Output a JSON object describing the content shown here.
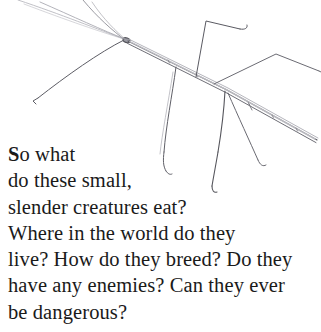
{
  "page": {
    "background_color": "#ffffff",
    "width": 321,
    "height": 332
  },
  "illustration": {
    "subject": "stick-insect",
    "alt_name": "walking stick insect pencil sketch",
    "style": "pencil line drawing",
    "line_color": "#4a4a50",
    "light_line_color": "#9b9ba3"
  },
  "caption": {
    "text_color": "#1a1a1a",
    "drop_cap": "S",
    "lines": [
      {
        "lead": "S",
        "rest": "o what"
      },
      {
        "lead": "",
        "rest": "do these small,"
      },
      {
        "lead": "",
        "rest": "slender creatures eat?"
      },
      {
        "lead": "",
        "rest": "Where in the world do they"
      },
      {
        "lead": "",
        "rest": "live? How do they breed? Do they"
      },
      {
        "lead": "",
        "rest": "have any enemies? Can they ever"
      },
      {
        "lead": "",
        "rest": "be dangerous?"
      }
    ],
    "full_text": "So what do these small, slender creatures eat? Where in the world do they live? How do they breed? Do they have any enemies? Can they ever be dangerous?"
  }
}
